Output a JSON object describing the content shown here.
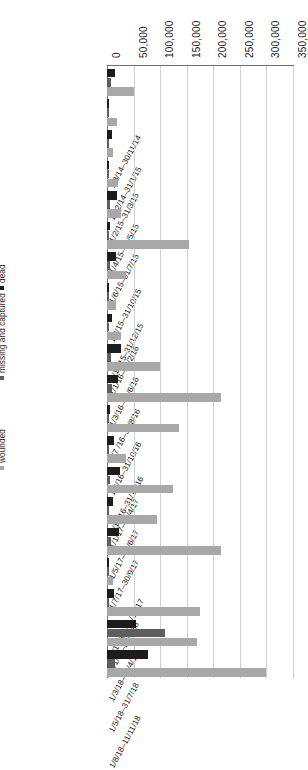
{
  "chart_data": {
    "type": "bar",
    "orientation": "horizontal",
    "title": "",
    "xlabel": "",
    "ylabel": "",
    "xlim": [
      0,
      350000
    ],
    "xticks": [
      "0",
      "50,000",
      "100,000",
      "150,000",
      "200,000",
      "250,000",
      "300,000",
      "350,000"
    ],
    "xtick_values": [
      0,
      50000,
      100000,
      150000,
      200000,
      250000,
      300000,
      350000
    ],
    "grid": true,
    "legend_position": "left",
    "legend": [
      "dead",
      "missing and captured",
      "wounded"
    ],
    "series_colors": [
      "#1c1c1c",
      "#5e5e5e",
      "#a8a8a8"
    ],
    "categories": [
      "1/8/14–30/11/14",
      "1/12/14–31/1/15",
      "1/2/15–31/3/15",
      "1/4/15–31/5/15",
      "1/6/15–31/7/15",
      "1/8/15–31/10/15",
      "1/11/15–31/12/15",
      "1/1/16–29/2/16",
      "1/3/16–30/6/16",
      "1/7 /16–31/8/16",
      "1/9/16–31/10/16",
      "1/11/16–31/12/16",
      "1/1/17–30/4/17",
      "1/5/17–30/6/17",
      "1/7/17–30/9/17",
      "1/10/17–31/12/17",
      "1/1/18–28/2/18",
      "1/3/18–30/4/18",
      "1/5/18–31/7/18",
      "1/8/18–11/11/18"
    ],
    "series": [
      {
        "name": "dead",
        "values": [
          15000,
          2500,
          8500,
          2500,
          19000,
          6500,
          16000,
          4000,
          9000,
          26000,
          21000,
          6000,
          14000,
          25000,
          11000,
          22000,
          2500,
          13000,
          55000,
          78000
        ]
      },
      {
        "name": "missing and captured",
        "values": [
          7000,
          1500,
          2000,
          1500,
          5000,
          2000,
          5500,
          1500,
          2500,
          7500,
          9000,
          2000,
          4000,
          6500,
          3000,
          8000,
          1000,
          3500,
          110000,
          15000
        ]
      },
      {
        "name": "wounded",
        "values": [
          51000,
          19000,
          11000,
          21000,
          27000,
          155000,
          35000,
          17000,
          26000,
          100000,
          215000,
          135000,
          35000,
          125000,
          95000,
          215000,
          12000,
          175000,
          170000,
          300000
        ]
      }
    ]
  }
}
